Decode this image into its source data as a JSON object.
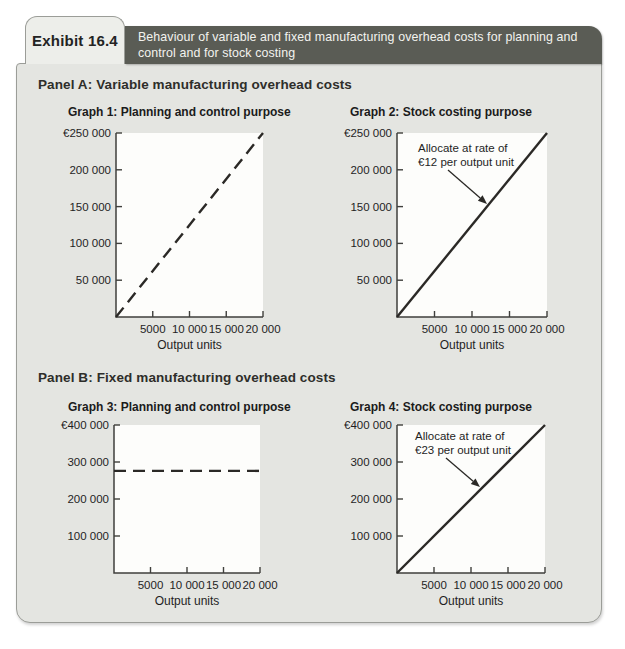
{
  "exhibit": {
    "label": "Exhibit 16.4",
    "title_lines": [
      "Behaviour of variable and fixed manufacturing overhead costs for planning and",
      "control and for stock costing"
    ]
  },
  "panels": [
    {
      "heading": "Panel A: Variable manufacturing overhead costs"
    },
    {
      "heading": "Panel B: Fixed manufacturing overhead costs"
    }
  ],
  "theme": {
    "header_bar_color": "#5a5c55",
    "panel_bg": "#e4e5e1",
    "label_box_bg": "#edeeea",
    "border_color": "#9b9d98",
    "plot_bg": "#fdfdfb",
    "axis_color": "#3f3f3c",
    "line_color": "#2b2926",
    "text_color": "#1f1f1f"
  },
  "chart_data": [
    {
      "name": "graph-1",
      "type": "line",
      "title": "Graph 1: Planning and control purpose",
      "xlabel": "Output units",
      "xlim": [
        0,
        20000
      ],
      "ylim": [
        0,
        250000
      ],
      "x_ticks": [
        {
          "value": 5000,
          "label": "5000"
        },
        {
          "value": 10000,
          "label": "10 000"
        },
        {
          "value": 15000,
          "label": "15 000"
        },
        {
          "value": 20000,
          "label": "20 000"
        }
      ],
      "y_ticks": [
        {
          "value": 50000,
          "label": "50 000"
        },
        {
          "value": 100000,
          "label": "100 000"
        },
        {
          "value": 150000,
          "label": "150 000"
        },
        {
          "value": 200000,
          "label": "200 000"
        },
        {
          "value": 250000,
          "label": "€250 000"
        }
      ],
      "line": {
        "style": "dashed",
        "points": [
          [
            0,
            0
          ],
          [
            20000,
            250000
          ]
        ]
      },
      "annotation": null,
      "plot": {
        "left": 116,
        "top": 133,
        "right": 263,
        "bottom": 317
      }
    },
    {
      "name": "graph-2",
      "type": "line",
      "title": "Graph 2: Stock costing purpose",
      "xlabel": "Output units",
      "xlim": [
        0,
        20000
      ],
      "ylim": [
        0,
        250000
      ],
      "rate_per_output_unit": 12,
      "x_ticks": [
        {
          "value": 5000,
          "label": "5000"
        },
        {
          "value": 10000,
          "label": "10 000"
        },
        {
          "value": 15000,
          "label": "15 000"
        },
        {
          "value": 20000,
          "label": "20 000"
        }
      ],
      "y_ticks": [
        {
          "value": 50000,
          "label": "50 000"
        },
        {
          "value": 100000,
          "label": "100 000"
        },
        {
          "value": 150000,
          "label": "150 000"
        },
        {
          "value": 200000,
          "label": "200 000"
        },
        {
          "value": 250000,
          "label": "€250 000"
        }
      ],
      "line": {
        "style": "solid",
        "points": [
          [
            0,
            0
          ],
          [
            20000,
            250000
          ]
        ]
      },
      "annotation": {
        "lines": [
          "Allocate at rate of",
          "€12 per output unit"
        ],
        "pos": {
          "x": 418,
          "y": 152
        },
        "line_height": 13.5,
        "arrow": {
          "from": [
            448,
            170
          ],
          "to": [
            487,
            204
          ]
        }
      },
      "plot": {
        "left": 397,
        "top": 133,
        "right": 547,
        "bottom": 317
      }
    },
    {
      "name": "graph-3",
      "type": "line",
      "title": "Graph 3: Planning and control purpose",
      "xlabel": "Output units",
      "xlim": [
        0,
        20000
      ],
      "ylim": [
        0,
        400000
      ],
      "x_ticks": [
        {
          "value": 5000,
          "label": "5000"
        },
        {
          "value": 10000,
          "label": "10 000"
        },
        {
          "value": 15000,
          "label": "15 000"
        },
        {
          "value": 20000,
          "label": "20 000"
        }
      ],
      "y_ticks": [
        {
          "value": 100000,
          "label": "100 000"
        },
        {
          "value": 200000,
          "label": "200 000"
        },
        {
          "value": 300000,
          "label": "300 000"
        },
        {
          "value": 400000,
          "label": "€400 000"
        }
      ],
      "line": {
        "style": "dashed",
        "points": [
          [
            0,
            276000
          ],
          [
            20000,
            276000
          ]
        ]
      },
      "annotation": null,
      "plot": {
        "left": 114,
        "top": 425,
        "right": 260,
        "bottom": 573
      }
    },
    {
      "name": "graph-4",
      "type": "line",
      "title": "Graph 4: Stock costing purpose",
      "xlabel": "Output units",
      "xlim": [
        0,
        20000
      ],
      "ylim": [
        0,
        400000
      ],
      "rate_per_output_unit": 23,
      "x_ticks": [
        {
          "value": 5000,
          "label": "5000"
        },
        {
          "value": 10000,
          "label": "10 000"
        },
        {
          "value": 15000,
          "label": "15 000"
        },
        {
          "value": 20000,
          "label": "20 000"
        }
      ],
      "y_ticks": [
        {
          "value": 100000,
          "label": "100 000"
        },
        {
          "value": 200000,
          "label": "200 000"
        },
        {
          "value": 300000,
          "label": "300 000"
        },
        {
          "value": 400000,
          "label": "€400 000"
        }
      ],
      "line": {
        "style": "solid",
        "points": [
          [
            0,
            0
          ],
          [
            20000,
            400000
          ]
        ]
      },
      "annotation": {
        "lines": [
          "Allocate at rate of",
          "€23 per output unit"
        ],
        "pos": {
          "x": 415,
          "y": 440
        },
        "line_height": 13.5,
        "arrow": {
          "from": [
            446,
            458
          ],
          "to": [
            480,
            487
          ]
        }
      },
      "plot": {
        "left": 397,
        "top": 425,
        "right": 545,
        "bottom": 573
      }
    }
  ]
}
